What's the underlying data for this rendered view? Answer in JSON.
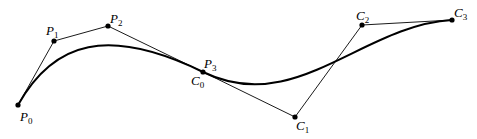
{
  "figure": {
    "curve1": {
      "points": [
        {
          "id": "P0",
          "letter": "P",
          "sub": "0",
          "x": 18,
          "y": 105,
          "lx": 20,
          "ly": 122
        },
        {
          "id": "P1",
          "letter": "P",
          "sub": "1",
          "x": 54,
          "y": 41,
          "lx": 46,
          "ly": 34
        },
        {
          "id": "P2",
          "letter": "P",
          "sub": "2",
          "x": 108,
          "y": 26,
          "lx": 110,
          "ly": 22
        },
        {
          "id": "P3",
          "letter": "P",
          "sub": "3",
          "x": 203,
          "y": 72,
          "lx": 204,
          "ly": 67
        }
      ]
    },
    "curve2": {
      "points": [
        {
          "id": "C0",
          "letter": "C",
          "sub": "0",
          "x": 203,
          "y": 72,
          "lx": 191,
          "ly": 86
        },
        {
          "id": "C1",
          "letter": "C",
          "sub": "1",
          "x": 295,
          "y": 117,
          "lx": 296,
          "ly": 132
        },
        {
          "id": "C2",
          "letter": "C",
          "sub": "2",
          "x": 362,
          "y": 25,
          "lx": 356,
          "ly": 20
        },
        {
          "id": "C3",
          "letter": "C",
          "sub": "3",
          "x": 452,
          "y": 20,
          "lx": 454,
          "ly": 17
        }
      ]
    },
    "labels": {
      "P0": "P",
      "P0_sub": "0",
      "P1": "P",
      "P1_sub": "1",
      "P2": "P",
      "P2_sub": "2",
      "P3": "P",
      "P3_sub": "3",
      "C0": "C",
      "C0_sub": "0",
      "C1": "C",
      "C1_sub": "1",
      "C2": "C",
      "C2_sub": "2",
      "C3": "C",
      "C3_sub": "3"
    }
  }
}
